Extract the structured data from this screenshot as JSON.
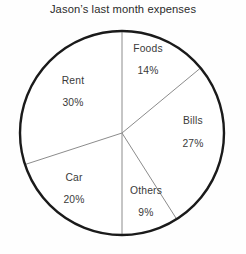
{
  "chart_data": {
    "type": "pie",
    "title": "Jason’s last month expenses",
    "xlabel": "",
    "ylabel": "",
    "legend": "none",
    "grid": false,
    "units": "percent",
    "total": 100,
    "start_angle_deg": 0,
    "direction": "clockwise",
    "categories": [
      "Foods",
      "Bills",
      "Others",
      "Car",
      "Rent"
    ],
    "values": [
      14,
      27,
      9,
      20,
      30
    ],
    "value_labels": [
      "14%",
      "27%",
      "9%",
      "20%",
      "30%"
    ],
    "slices": [
      {
        "name": "Foods",
        "value": 14,
        "value_label": "14%",
        "start_deg": 0,
        "end_deg": 50.4,
        "fill": "#ffffff",
        "label_x": 148,
        "label_y": 48,
        "value_x": 148,
        "value_y": 70
      },
      {
        "name": "Bills",
        "value": 27,
        "value_label": "27%",
        "start_deg": 50.4,
        "end_deg": 147.6,
        "fill": "#ffffff",
        "label_x": 193,
        "label_y": 120,
        "value_x": 193,
        "value_y": 143
      },
      {
        "name": "Others",
        "value": 9,
        "value_label": "9%",
        "start_deg": 147.6,
        "end_deg": 180,
        "fill": "#ffffff",
        "label_x": 146,
        "label_y": 190,
        "value_x": 146,
        "value_y": 212
      },
      {
        "name": "Car",
        "value": 20,
        "value_label": "20%",
        "start_deg": 180,
        "end_deg": 252,
        "fill": "#ffffff",
        "label_x": 74,
        "label_y": 177,
        "value_x": 74,
        "value_y": 199
      },
      {
        "name": "Rent",
        "value": 30,
        "value_label": "30%",
        "start_deg": 252,
        "end_deg": 360,
        "fill": "#ffffff",
        "label_x": 73,
        "label_y": 80,
        "value_x": 73,
        "value_y": 102
      }
    ],
    "geometry": {
      "center_x": 122,
      "center_y": 133,
      "radius": 102
    },
    "colors": {
      "background": "#fefefe",
      "outline": "#1a1a1a",
      "divider": "#8c8c8c",
      "title_text": "#2b2b2b",
      "label_text": "#3a3a3a"
    }
  }
}
